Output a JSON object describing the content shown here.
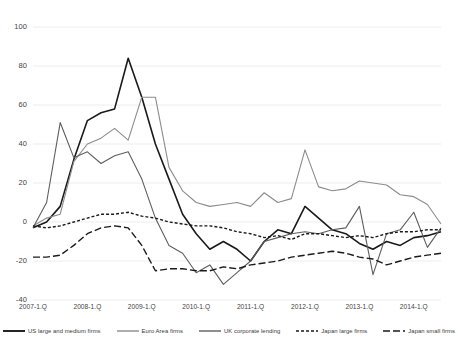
{
  "chart_data": {
    "type": "line",
    "title": "",
    "subtitle": "",
    "xlabel": "",
    "ylabel": "",
    "ylim": [
      -40,
      100
    ],
    "yticks": [
      -40,
      -20,
      0,
      20,
      40,
      60,
      80,
      100
    ],
    "ytick_labels": [
      "-40",
      "-20",
      "0",
      "20",
      "40",
      "60",
      "80",
      "100"
    ],
    "grid": true,
    "legend_position": "bottom",
    "x": [
      "2007-1.Q",
      "2007-2.Q",
      "2007-3.Q",
      "2007-4.Q",
      "2008-1.Q",
      "2008-2.Q",
      "2008-3.Q",
      "2008-4.Q",
      "2009-1.Q",
      "2009-2.Q",
      "2009-3.Q",
      "2009-4.Q",
      "2010-1.Q",
      "2010-2.Q",
      "2010-3.Q",
      "2010-4.Q",
      "2011-1.Q",
      "2011-2.Q",
      "2011-3.Q",
      "2011-4.Q",
      "2012-1.Q",
      "2012-2.Q",
      "2012-3.Q",
      "2012-4.Q",
      "2013-1.Q",
      "2013-2.Q",
      "2013-3.Q",
      "2013-4.Q",
      "2014-1.Q",
      "2014-2.Q",
      "2014-3.Q"
    ],
    "xtick_labels": [
      "2007-1.Q",
      "2008-1.Q",
      "2009-1.Q",
      "2010-1.Q",
      "2011-1.Q",
      "2012-1.Q",
      "2013-1.Q",
      "2014-1.Q"
    ],
    "xtick_indices": [
      0,
      4,
      8,
      12,
      16,
      20,
      24,
      28
    ],
    "series": [
      {
        "name": "US large and medium firms",
        "color": "#1a1a1a",
        "width": 1.6,
        "dash": "none",
        "values": [
          -3,
          0,
          8,
          32,
          52,
          56,
          58,
          84,
          64,
          40,
          22,
          4,
          -6,
          -14,
          -10,
          -14,
          -20,
          -10,
          -4,
          -6,
          8,
          2,
          -4,
          -6,
          -11,
          -14,
          -10,
          -12,
          -8,
          -7,
          -5
        ]
      },
      {
        "name": "Euro Area firms",
        "color": "#8c8c8c",
        "width": 1.1,
        "dash": "none",
        "values": [
          -2,
          2,
          4,
          31,
          40,
          43,
          48,
          42,
          64,
          64,
          28,
          16,
          10,
          8,
          9,
          10,
          8,
          15,
          10,
          12,
          37,
          18,
          16,
          17,
          21,
          20,
          19,
          14,
          13,
          9,
          -1
        ]
      },
      {
        "name": "UK corporate lending",
        "color": "#5e5e5e",
        "width": 1.1,
        "dash": "none",
        "values": [
          -3,
          10,
          51,
          33,
          36,
          30,
          34,
          36,
          22,
          2,
          -12,
          -16,
          -26,
          -22,
          -32,
          -26,
          -20,
          -10,
          -8,
          -6,
          -5,
          -6,
          -4,
          -3,
          8,
          -27,
          -6,
          -4,
          5,
          -13,
          -3
        ]
      },
      {
        "name": "Japan large firms",
        "color": "#1a1a1a",
        "width": 1.4,
        "dash": "3,2",
        "values": [
          -2,
          -3,
          -2,
          0,
          2,
          4,
          4,
          5,
          3,
          2,
          0,
          -1,
          -2,
          -2,
          -3,
          -5,
          -6,
          -8,
          -7,
          -9,
          -6,
          -6,
          -7,
          -8,
          -7,
          -8,
          -6,
          -5,
          -5,
          -4,
          -4
        ]
      },
      {
        "name": "Japan small firms",
        "color": "#1a1a1a",
        "width": 1.4,
        "dash": "7,3",
        "values": [
          -18,
          -18,
          -17,
          -12,
          -6,
          -3,
          -2,
          -3,
          -12,
          -25,
          -24,
          -24,
          -25,
          -25,
          -23,
          -24,
          -22,
          -21,
          -20,
          -18,
          -17,
          -16,
          -15,
          -16,
          -18,
          -19,
          -22,
          -20,
          -18,
          -17,
          -16
        ]
      }
    ]
  }
}
